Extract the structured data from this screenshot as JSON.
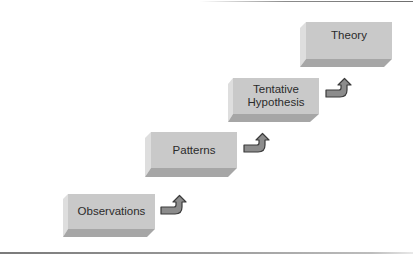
{
  "diagram": {
    "type": "staircase-flow",
    "steps": [
      {
        "label": "Observations",
        "order": 1
      },
      {
        "label": "Patterns",
        "order": 2
      },
      {
        "label": "Tentative Hypothesis",
        "order": 3
      },
      {
        "label": "Theory",
        "order": 4
      }
    ],
    "connectors": [
      {
        "from": "Observations",
        "to": "Patterns",
        "icon": "curved-up-arrow-icon"
      },
      {
        "from": "Patterns",
        "to": "Tentative Hypothesis",
        "icon": "curved-up-arrow-icon"
      },
      {
        "from": "Tentative Hypothesis",
        "to": "Theory",
        "icon": "curved-up-arrow-icon"
      }
    ],
    "colors": {
      "face": "#c9c9c9",
      "left_bevel": "#dedede",
      "bottom_bevel": "#a6a6a6",
      "arrow_fill": "#8c8c8c",
      "arrow_stroke": "#3a3a3a",
      "text": "#2b2b2b"
    }
  },
  "labels": {
    "step1": "Observations",
    "step2": "Patterns",
    "step3_line1": "Tentative",
    "step3_line2": "Hypothesis",
    "step4": "Theory"
  }
}
